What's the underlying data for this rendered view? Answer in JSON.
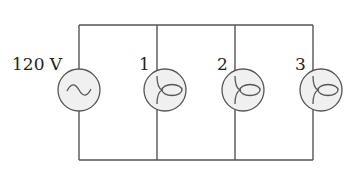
{
  "diagram": {
    "type": "parallel circuit",
    "source": {
      "label": "120 V",
      "symbol": "ac-source",
      "glyph": "~"
    },
    "bulbs": [
      {
        "label": "1"
      },
      {
        "label": "2"
      },
      {
        "label": "3"
      }
    ],
    "colors": {
      "wire": "#555555",
      "component_fill": "#f0f0f0",
      "text": "#222222"
    }
  }
}
